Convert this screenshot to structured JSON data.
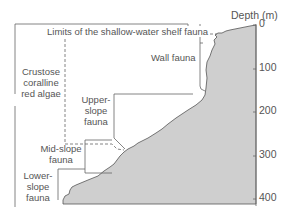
{
  "diagram": {
    "axis": {
      "title": "Depth (m)",
      "ticks": [
        "0",
        "100",
        "200",
        "300",
        "400"
      ]
    },
    "labels": {
      "shelf": "Limits of the shallow-water shelf fauna",
      "wall": "Wall fauna",
      "algae_line1": "Crustose",
      "algae_line2": "coralline",
      "algae_line3": "red algae",
      "upper_line1": "Upper-",
      "upper_line2": "slope",
      "upper_line3": "fauna",
      "mid_line1": "Mid-slope",
      "mid_line2": "fauna",
      "lower_line1": "Lower-",
      "lower_line2": "slope",
      "lower_line3": "fauna"
    },
    "colors": {
      "seafloor_fill": "#cfcfcf",
      "line": "#555555",
      "text": "#555555"
    }
  }
}
